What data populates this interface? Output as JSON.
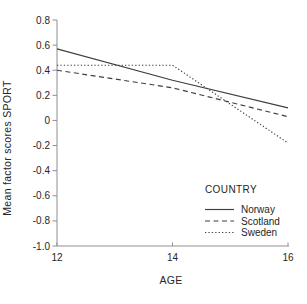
{
  "chart_data": {
    "type": "line",
    "x": [
      12,
      14,
      16
    ],
    "series": [
      {
        "name": "Norway",
        "style": "solid",
        "values": [
          0.57,
          0.32,
          0.1
        ]
      },
      {
        "name": "Scotland",
        "style": "dashed",
        "values": [
          0.4,
          0.26,
          0.03
        ]
      },
      {
        "name": "Sweden",
        "style": "dotted",
        "values": [
          0.44,
          0.44,
          -0.18
        ]
      }
    ],
    "title": "",
    "xlabel": "AGE",
    "ylabel": "Mean factor scores SPORT",
    "legend": {
      "title": "COUNTRY",
      "position": "lower-right"
    },
    "xlim": [
      12,
      16
    ],
    "ylim": [
      -1.0,
      0.8
    ],
    "xticks": [
      12,
      14,
      16
    ],
    "xtick_labels": [
      "12",
      "14",
      "16"
    ],
    "yticks": [
      0.8,
      0.6,
      0.4,
      0.2,
      0,
      -0.2,
      -0.4,
      -0.6,
      -0.8,
      -1.0
    ],
    "ytick_labels": [
      "0.8",
      "0.6",
      "0.4",
      "0.2",
      "0",
      "-0.2",
      "-0.4",
      "-0.6",
      "-0.8",
      "-1.0"
    ],
    "grid": false,
    "colors": {
      "line": "#3f3f3f",
      "axis": "#8f8f8f",
      "text": "#262626",
      "background": "#ffffff"
    }
  }
}
